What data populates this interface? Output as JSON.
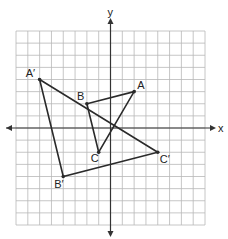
{
  "diagram": {
    "type": "coordinate-plane-transformation",
    "grid": {
      "xmin": -8,
      "xmax": 8,
      "ymin": -8,
      "ymax": 8,
      "step": 1
    },
    "axes": {
      "x_label": "x",
      "y_label": "y"
    },
    "colors": {
      "grid": "#b8b8b8",
      "axis": "#333333",
      "shape": "#2a2a2a",
      "background": "#ffffff"
    },
    "triangles": [
      {
        "name": "ABC",
        "vertices": [
          {
            "label": "A",
            "x": 2,
            "y": 3
          },
          {
            "label": "B",
            "x": -2,
            "y": 2
          },
          {
            "label": "C",
            "x": -1,
            "y": -2
          }
        ]
      },
      {
        "name": "A'B'C'",
        "vertices": [
          {
            "label": "A′",
            "x": -6,
            "y": 4
          },
          {
            "label": "B′",
            "x": -4,
            "y": -4
          },
          {
            "label": "C′",
            "x": 4,
            "y": -2
          }
        ]
      }
    ]
  }
}
